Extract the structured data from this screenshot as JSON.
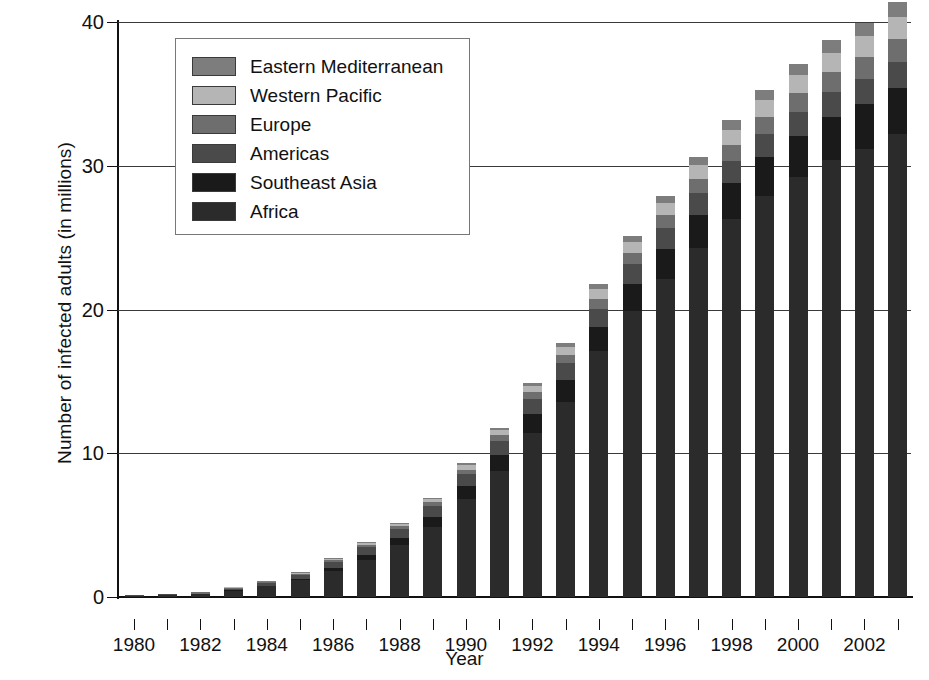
{
  "chart_data": {
    "type": "bar",
    "stacked": true,
    "title": "",
    "xlabel": "Year",
    "ylabel": "Number of infected adults (in millions)",
    "ylim": [
      0,
      40
    ],
    "yticks": [
      0,
      10,
      20,
      30,
      40
    ],
    "ytick_labels": [
      "0",
      "10",
      "20",
      "30",
      "40"
    ],
    "grid": "horizontal",
    "legend_position": "upper-left-inside",
    "categories": [
      1980,
      1981,
      1982,
      1983,
      1984,
      1985,
      1986,
      1987,
      1988,
      1989,
      1990,
      1991,
      1992,
      1993,
      1994,
      1995,
      1996,
      1997,
      1998,
      1999,
      2000,
      2001,
      2002,
      2003
    ],
    "xtick_labels": [
      "1980",
      "",
      "1982",
      "",
      "1984",
      "",
      "1986",
      "",
      "1988",
      "",
      "1990",
      "",
      "1992",
      "",
      "1994",
      "",
      "1996",
      "",
      "1998",
      "",
      "2000",
      "",
      "2002",
      ""
    ],
    "series": [
      {
        "name": "Africa",
        "color": "#2b2b2b",
        "values": [
          0.08,
          0.12,
          0.18,
          0.45,
          0.75,
          1.15,
          1.8,
          2.6,
          3.6,
          4.9,
          6.8,
          8.8,
          11.4,
          13.6,
          17.1,
          19.9,
          22.1,
          24.3,
          26.3,
          27.9,
          29.2,
          30.4,
          31.2,
          32.2
        ]
      },
      {
        "name": "Southeast Asia",
        "color": "#1a1a1a",
        "values": [
          0.0,
          0.0,
          0.0,
          0.02,
          0.05,
          0.1,
          0.2,
          0.35,
          0.5,
          0.7,
          0.9,
          1.1,
          1.3,
          1.5,
          1.7,
          1.9,
          2.1,
          2.3,
          2.5,
          2.7,
          2.9,
          3.0,
          3.1,
          3.2
        ]
      },
      {
        "name": "Americas",
        "color": "#4a4a4a",
        "values": [
          0.02,
          0.04,
          0.06,
          0.12,
          0.2,
          0.3,
          0.45,
          0.55,
          0.65,
          0.75,
          0.85,
          0.95,
          1.05,
          1.15,
          1.25,
          1.35,
          1.45,
          1.5,
          1.55,
          1.6,
          1.65,
          1.7,
          1.75,
          1.8
        ]
      },
      {
        "name": "Europe",
        "color": "#6e6e6e",
        "values": [
          0.0,
          0.0,
          0.01,
          0.02,
          0.04,
          0.07,
          0.1,
          0.15,
          0.2,
          0.25,
          0.32,
          0.4,
          0.5,
          0.6,
          0.7,
          0.8,
          0.9,
          1.0,
          1.1,
          1.2,
          1.3,
          1.4,
          1.5,
          1.6
        ]
      },
      {
        "name": "Western Pacific",
        "color": "#b5b5b5",
        "values": [
          0.0,
          0.0,
          0.0,
          0.01,
          0.02,
          0.04,
          0.06,
          0.1,
          0.15,
          0.2,
          0.28,
          0.36,
          0.45,
          0.55,
          0.65,
          0.75,
          0.85,
          0.95,
          1.05,
          1.15,
          1.25,
          1.35,
          1.45,
          1.55
        ]
      },
      {
        "name": "Eastern Mediterranean",
        "color": "#7d7d7d",
        "values": [
          0.0,
          0.0,
          0.0,
          0.0,
          0.01,
          0.02,
          0.03,
          0.05,
          0.08,
          0.1,
          0.14,
          0.18,
          0.22,
          0.28,
          0.35,
          0.42,
          0.5,
          0.58,
          0.65,
          0.72,
          0.8,
          0.88,
          0.95,
          1.02
        ]
      }
    ],
    "totals": [
      0.1,
      0.16,
      0.25,
      0.62,
      1.07,
      1.68,
      2.64,
      3.8,
      5.18,
      6.9,
      9.29,
      11.79,
      14.92,
      17.68,
      21.75,
      25.12,
      27.9,
      30.63,
      33.15,
      35.27,
      37.1,
      38.73,
      39.95,
      41.37
    ],
    "legend_order_top_to_bottom": [
      "Eastern Mediterranean",
      "Western Pacific",
      "Europe",
      "Americas",
      "Southeast Asia",
      "Africa"
    ]
  }
}
